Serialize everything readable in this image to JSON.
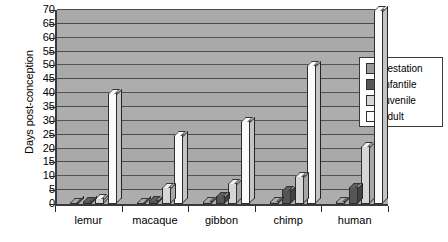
{
  "chart_data": {
    "type": "bar",
    "title": "",
    "xlabel": "",
    "ylabel": "Days post-conception",
    "ylim": [
      0,
      70
    ],
    "ytick_step": 5,
    "yticks": [
      0,
      5,
      10,
      15,
      20,
      25,
      30,
      35,
      40,
      45,
      50,
      55,
      60,
      65,
      70
    ],
    "ytick_labels": [
      "0",
      "5",
      "10",
      "15",
      "20",
      "25",
      "30",
      "35",
      "40",
      "45",
      "50",
      "55",
      "60",
      "65",
      "70"
    ],
    "grid": true,
    "legend_position": "right",
    "categories": [
      "lemur",
      "macaque",
      "gibbon",
      "chimp",
      "human"
    ],
    "series": [
      {
        "name": "gestation",
        "color": "#9a9a9a",
        "values": [
          0.5,
          0.5,
          1,
          1,
          1
        ]
      },
      {
        "name": "infantile",
        "color": "#555555",
        "values": [
          1,
          1.5,
          3,
          5,
          6
        ]
      },
      {
        "name": "juvenile",
        "color": "#d6d6d6",
        "values": [
          2,
          6,
          7.5,
          10,
          21
        ]
      },
      {
        "name": "adult",
        "color": "#fbfbfb",
        "values": [
          40,
          25,
          30,
          50,
          70
        ]
      }
    ]
  },
  "legend": {
    "items": [
      {
        "label": "gestation"
      },
      {
        "label": "infantile"
      },
      {
        "label": "juvenile"
      },
      {
        "label": "adult"
      }
    ]
  },
  "axes": {
    "y_title": "Days post-conception"
  }
}
